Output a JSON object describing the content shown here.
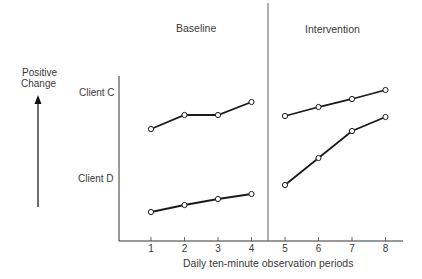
{
  "chart_data": {
    "type": "line",
    "title": "",
    "xlabel": "Daily ten-minute observation periods",
    "ylabel": "Positive Change",
    "x": [
      1,
      2,
      3,
      4,
      5,
      6,
      7,
      8
    ],
    "phases": [
      {
        "name": "Baseline",
        "x_range": [
          1,
          4
        ]
      },
      {
        "name": "Intervention",
        "x_range": [
          5,
          8
        ]
      }
    ],
    "phase_change_line_x": 4.5,
    "y_units": "relative (no numeric scale shown; values are px above x-axis)",
    "grid": false,
    "legend": "none (series labeled inline at left of y-axis)",
    "series": [
      {
        "name": "Client C",
        "values": [
          112,
          126,
          126,
          139,
          125,
          134,
          142,
          151
        ]
      },
      {
        "name": "Client D",
        "values": [
          29,
          36,
          42,
          47,
          56,
          83,
          110,
          124
        ]
      }
    ]
  },
  "labels": {
    "baseline": "Baseline",
    "intervention": "Intervention",
    "positive": "Positive",
    "change": "Change",
    "client_c": "Client C",
    "client_d": "Client D",
    "xlabel": "Daily ten-minute observation periods",
    "ticks": [
      "1",
      "2",
      "3",
      "4",
      "5",
      "6",
      "7",
      "8"
    ]
  }
}
